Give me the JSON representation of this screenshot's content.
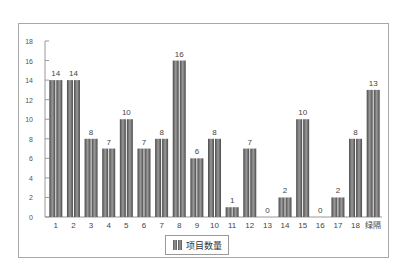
{
  "chart_data": {
    "type": "bar",
    "title": "",
    "xlabel": "",
    "ylabel": "",
    "categories": [
      "1",
      "2",
      "3",
      "4",
      "5",
      "6",
      "7",
      "8",
      "9",
      "10",
      "11",
      "12",
      "13",
      "14",
      "15",
      "16",
      "17",
      "18",
      "绿隔"
    ],
    "series": [
      {
        "name": "项目数量",
        "values": [
          14,
          14,
          8,
          7,
          10,
          7,
          8,
          16,
          6,
          8,
          1,
          7,
          0,
          2,
          10,
          0,
          2,
          8,
          13
        ]
      }
    ],
    "ylim": [
      0,
      18
    ],
    "yticks": [
      0,
      2,
      4,
      6,
      8,
      10,
      12,
      14,
      16,
      18
    ],
    "grid": false,
    "legend_position": "bottom",
    "data_labels": true,
    "bar_color": "#6e6e6e"
  },
  "legend": {
    "label": "项目数量"
  }
}
